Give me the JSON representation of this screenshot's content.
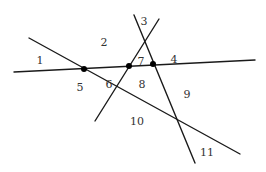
{
  "diagram": {
    "colors": {
      "line": "#1a1a1a",
      "point": "#000000",
      "label": "#333333",
      "background": "#ffffff"
    },
    "lines": [
      {
        "id": "line-a",
        "x1": 14,
        "y1": 72,
        "x2": 255,
        "y2": 60
      },
      {
        "id": "line-b",
        "x1": 29,
        "y1": 38,
        "x2": 240,
        "y2": 154
      },
      {
        "id": "line-c",
        "x1": 159,
        "y1": 19,
        "x2": 95,
        "y2": 121
      },
      {
        "id": "line-d",
        "x1": 134,
        "y1": 15,
        "x2": 195,
        "y2": 163
      }
    ],
    "points": [
      {
        "id": "p1",
        "cx": 84,
        "cy": 69
      },
      {
        "id": "p2",
        "cx": 129,
        "cy": 66
      },
      {
        "id": "p3",
        "cx": 153,
        "cy": 64
      }
    ],
    "regions": [
      {
        "label": "1",
        "x": 40,
        "y": 64
      },
      {
        "label": "2",
        "x": 104,
        "y": 46
      },
      {
        "label": "3",
        "x": 144,
        "y": 25
      },
      {
        "label": "4",
        "x": 174,
        "y": 63
      },
      {
        "label": "5",
        "x": 80,
        "y": 91
      },
      {
        "label": "6",
        "x": 109,
        "y": 88
      },
      {
        "label": "7",
        "x": 141,
        "y": 65
      },
      {
        "label": "8",
        "x": 142,
        "y": 88
      },
      {
        "label": "9",
        "x": 187,
        "y": 98
      },
      {
        "label": "10",
        "x": 137,
        "y": 125
      },
      {
        "label": "11",
        "x": 207,
        "y": 156
      }
    ]
  }
}
